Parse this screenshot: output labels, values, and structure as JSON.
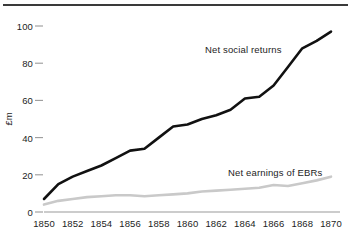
{
  "chart_data": {
    "type": "line",
    "title": "",
    "subtitle": "",
    "xlabel": "",
    "ylabel": "£m",
    "xlim": [
      1850,
      1870
    ],
    "ylim": [
      0,
      100
    ],
    "xticks": [
      1850,
      1852,
      1854,
      1856,
      1858,
      1860,
      1862,
      1864,
      1866,
      1868,
      1870
    ],
    "yticks": [
      0,
      20,
      40,
      60,
      80,
      100
    ],
    "xtick_labels": [
      "1850",
      "1852",
      "1854",
      "1856",
      "1858",
      "1860",
      "1862",
      "1864",
      "1866",
      "1868",
      "1870"
    ],
    "ytick_labels": [
      "0",
      "20",
      "40",
      "60",
      "80",
      "100"
    ],
    "grid": false,
    "legend_position": "inline-annotations",
    "x": [
      1850,
      1851,
      1852,
      1853,
      1854,
      1855,
      1856,
      1857,
      1858,
      1859,
      1860,
      1861,
      1862,
      1863,
      1864,
      1865,
      1866,
      1867,
      1868,
      1869,
      1870
    ],
    "series": [
      {
        "name": "Net social returns",
        "color": "#111111",
        "linewidth": 2.6,
        "values": [
          7,
          15,
          19,
          22,
          25,
          29,
          33,
          34,
          40,
          46,
          47,
          50,
          52,
          55,
          61,
          62,
          68,
          78,
          88,
          92,
          97
        ]
      },
      {
        "name": "Net earnings of EBRs",
        "color": "#c9c9c9",
        "linewidth": 2.6,
        "values": [
          4,
          6,
          7,
          8,
          8.5,
          9,
          9,
          8.5,
          9,
          9.5,
          10,
          11,
          11.5,
          12,
          12.5,
          13,
          14.5,
          14,
          15.5,
          17,
          19
        ]
      }
    ],
    "annotations": [
      {
        "text": "Net social returns",
        "series": "Net social returns"
      },
      {
        "text": "Net earnings of EBRs",
        "series": "Net earnings of EBRs"
      }
    ],
    "axis_line_color": "#9a9a9a",
    "tick_mark_color": "#9a9a9a",
    "top_rule_color": "#3a3a3a"
  }
}
